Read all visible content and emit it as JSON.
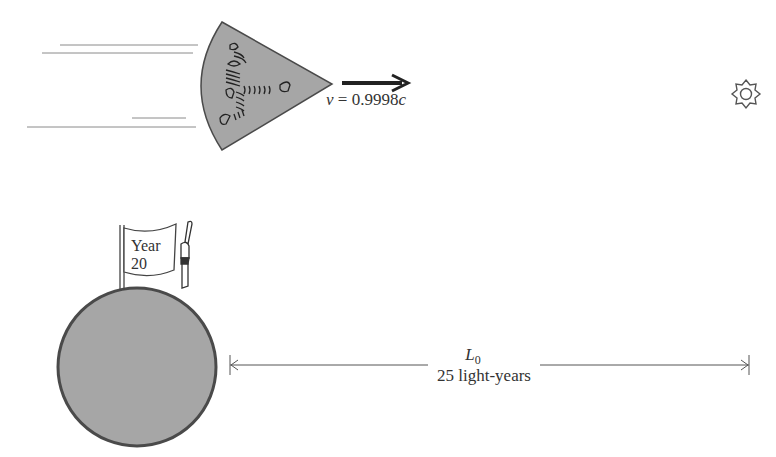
{
  "diagram": {
    "spaceship": {
      "velocity_label": "v = 0.9998c",
      "velocity_symbol": "v",
      "velocity_value": "= 0.9998",
      "velocity_unit": "c",
      "direction": "right"
    },
    "star": {
      "icon": "sun-icon"
    },
    "planet": {
      "flag_line1": "Year",
      "flag_line2": "20"
    },
    "distance": {
      "symbol": "L",
      "subscript": "0",
      "value_label": "25 light-years"
    },
    "colors": {
      "fill": "#a6a6a6",
      "stroke": "#4a4a4a",
      "text": "#333333",
      "background": "#ffffff"
    }
  }
}
